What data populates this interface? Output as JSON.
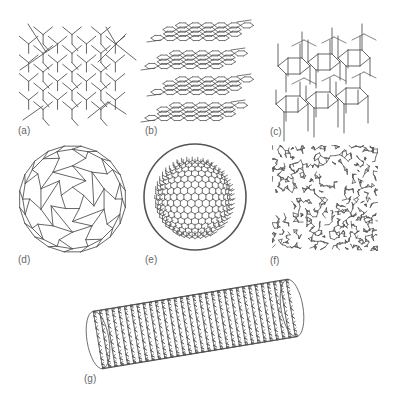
{
  "figure": {
    "line_color": "#555555",
    "label_color": "#666666",
    "background": "#ffffff",
    "panels": [
      {
        "id": "a",
        "label": "(a)",
        "structure": "diamond",
        "box": [
          18,
          22,
          108,
          100
        ],
        "label_pos": [
          18,
          126
        ]
      },
      {
        "id": "b",
        "label": "(b)",
        "structure": "graphite",
        "box": [
          145,
          18,
          102,
          104
        ],
        "label_pos": [
          145,
          126
        ]
      },
      {
        "id": "c",
        "label": "(c)",
        "structure": "lonsdaleite",
        "box": [
          272,
          20,
          104,
          104
        ],
        "label_pos": [
          270,
          127
        ]
      },
      {
        "id": "d",
        "label": "(d)",
        "structure": "C60 fullerene",
        "box": [
          19,
          145,
          107,
          106
        ],
        "label_pos": [
          18,
          255
        ]
      },
      {
        "id": "e",
        "label": "(e)",
        "structure": "C540 fullerene",
        "box": [
          143,
          143,
          104,
          108
        ],
        "label_pos": [
          145,
          255
        ]
      },
      {
        "id": "f",
        "label": "(f)",
        "structure": "amorphous carbon",
        "box": [
          272,
          145,
          106,
          106
        ],
        "label_pos": [
          270,
          256
        ]
      },
      {
        "id": "g",
        "label": "(g)",
        "structure": "single-walled carbon nanotube",
        "box": [
          84,
          277,
          222,
          93
        ],
        "label_pos": [
          84,
          374
        ]
      }
    ]
  }
}
